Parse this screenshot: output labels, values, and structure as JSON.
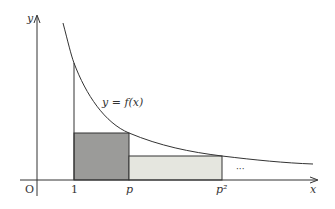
{
  "diagram": {
    "type": "function-graph-with-rectangles",
    "axes": {
      "x_label": "x",
      "y_label": "y",
      "origin_label": "O"
    },
    "x_ticks": [
      {
        "label": "1",
        "x": 74
      },
      {
        "label": "p",
        "x": 129
      },
      {
        "label": "p²",
        "x": 222
      }
    ],
    "curve_label": "y = f(x)",
    "continuation": "···",
    "rectangles": [
      {
        "name": "rect-1-to-p",
        "from": "1",
        "to": "p",
        "fill": "#9b9b99"
      },
      {
        "name": "rect-p-to-p2",
        "from": "p",
        "to": "p²",
        "fill": "#e5e6df"
      }
    ],
    "colors": {
      "axis": "#333333",
      "curve": "#333333",
      "dark_rect": "#9b9b99",
      "light_rect": "#e5e6df"
    }
  }
}
